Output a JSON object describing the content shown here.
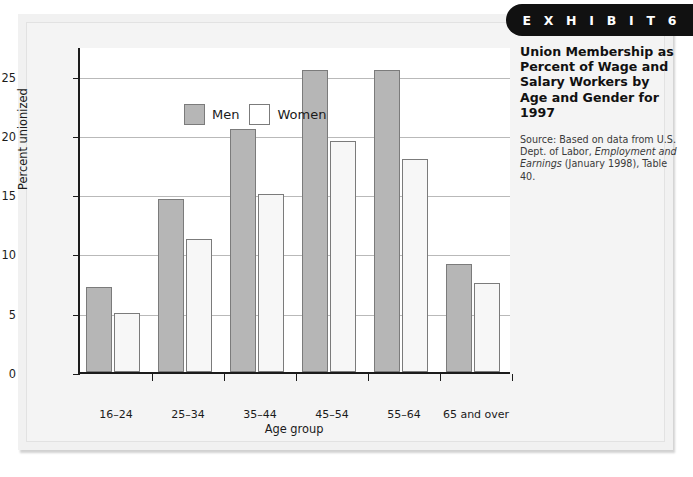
{
  "exhibit": {
    "banner_label": "E X H I B I T   6"
  },
  "side_panel": {
    "title": "Union Membership as Percent of Wage and Salary Workers by Age and Gender for 1997",
    "source_prefix": "Source: Based on data from U.S. Dept. of Labor, ",
    "source_italic": "Employment and Earnings",
    "source_suffix": " (January 1998), Table 40."
  },
  "chart_data": {
    "type": "bar",
    "title": "Union Membership as Percent of Wage and Salary Workers by Age and Gender for 1997",
    "xlabel": "Age group",
    "ylabel": "Percent unionized",
    "ylim": [
      0,
      27.5
    ],
    "yticks": [
      0,
      5,
      10,
      15,
      20,
      25
    ],
    "ytick_labels": [
      "0",
      "5",
      "10",
      "15",
      "20",
      "25"
    ],
    "grid": true,
    "legend_position": "upper-left-inside",
    "categories": [
      "16–24",
      "25–34",
      "35–44",
      "45–54",
      "55–64",
      "65 and over"
    ],
    "series": [
      {
        "name": "Men",
        "color": "#b6b6b6",
        "values": [
          7.2,
          14.6,
          20.5,
          25.5,
          25.5,
          9.1
        ]
      },
      {
        "name": "Women",
        "color": "#f7f7f7",
        "values": [
          5.0,
          11.2,
          15.0,
          19.5,
          18.0,
          7.5
        ]
      }
    ]
  }
}
